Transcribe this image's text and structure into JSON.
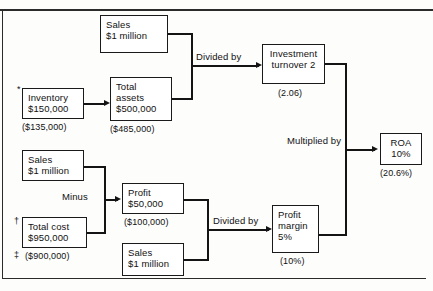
{
  "diagram": {
    "type": "roa-decomposition-flowchart",
    "nodes": {
      "sales_top": {
        "line1": "Sales",
        "line2": "$1 million"
      },
      "inventory": {
        "line1": "Inventory",
        "line2": "$150,000",
        "alt": "($135,000)",
        "marker": "*"
      },
      "total_assets": {
        "line1": "Total",
        "line2": "assets",
        "line3": "$500,000",
        "alt": "($485,000)"
      },
      "investment_turnover": {
        "line1": "Investment",
        "line2": "turnover 2",
        "alt": "(2.06)"
      },
      "roa": {
        "line1": "ROA",
        "line2": "10%",
        "alt": "(20.6%)"
      },
      "sales_mid": {
        "line1": "Sales",
        "line2": "$1 million"
      },
      "total_cost": {
        "line1": "Total cost",
        "line2": "$950,000",
        "alt": "($900,000)",
        "marker": "†",
        "alt_marker": "‡"
      },
      "profit": {
        "line1": "Profit",
        "line2": "$50,000",
        "alt": "($100,000)"
      },
      "sales_bottom": {
        "line1": "Sales",
        "line2": "$1 million"
      },
      "profit_margin": {
        "line1": "Profit",
        "line2": "margin",
        "line3": "5%",
        "alt": "(10%)"
      }
    },
    "operations": {
      "divided_by_top": "Divided by",
      "multiplied_by": "Multiplied by",
      "minus": "Minus",
      "divided_by_bottom": "Divided by"
    },
    "colors": {
      "ink": "#141414",
      "box_border": "#1a1a1a",
      "paper": "#fdfdfc"
    }
  }
}
